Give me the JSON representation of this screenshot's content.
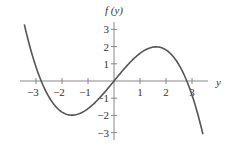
{
  "chart_data": {
    "type": "line",
    "title": "",
    "xlabel": "y",
    "ylabel": "f(y)",
    "xlim": [
      -3.6,
      3.6
    ],
    "ylim": [
      -3.4,
      3.4
    ],
    "xticks": [
      -3,
      -2,
      -1,
      1,
      2,
      3
    ],
    "yticks": [
      -3,
      -2,
      -1,
      1,
      2,
      3
    ],
    "xtick_labels": [
      "−3",
      "−2",
      "−1",
      "1",
      "2",
      "3"
    ],
    "ytick_labels": [
      "−3",
      "−2",
      "−1",
      "1",
      "2",
      "3"
    ],
    "grid": false,
    "legend": null,
    "series": [
      {
        "name": "f(y)",
        "description": "odd cubic-like curve; roots near y=-2.8, 0, 2.8; local min about (-1.6,-2.0); local max about (1.6,2.0)",
        "x": [
          -3.4,
          -3.0,
          -2.8,
          -2.5,
          -2.0,
          -1.6,
          -1.0,
          -0.5,
          0,
          0.5,
          1.0,
          1.6,
          2.0,
          2.5,
          2.8,
          3.0,
          3.4
        ],
        "values": [
          3.1,
          1.0,
          0.0,
          -1.0,
          -1.8,
          -2.0,
          -1.6,
          -0.9,
          0.0,
          0.9,
          1.6,
          2.0,
          1.8,
          1.0,
          0.0,
          -1.0,
          -3.1
        ]
      }
    ]
  },
  "colors": {
    "curve": "#555555",
    "axes": "#888888",
    "text": "#333333"
  },
  "labels": {
    "x_axis_label": "y",
    "y_axis_label": "f (y)"
  }
}
